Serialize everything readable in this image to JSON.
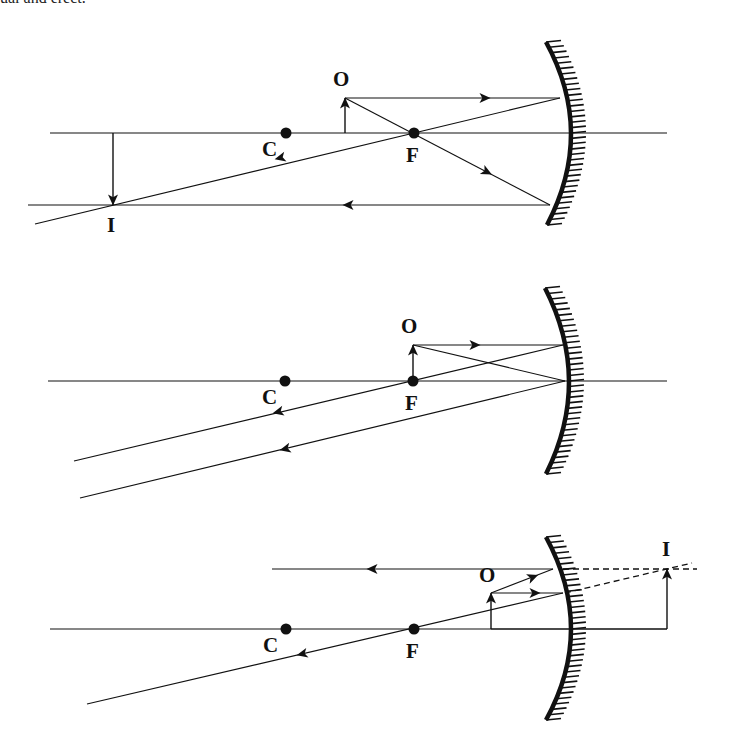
{
  "caption_fragment": "ual and erect.",
  "colors": {
    "ink": "#111111",
    "background": "#ffffff"
  },
  "diagrams": [
    {
      "id": "object-beyond-focus",
      "axis": {
        "y": 133,
        "x1": 50,
        "x2": 667
      },
      "mirror": {
        "top": [
          546,
          42
        ],
        "vertex": [
          571,
          133
        ],
        "bottom": [
          547,
          225
        ]
      },
      "points": [
        {
          "label": "C",
          "x": 286,
          "y": 133,
          "lx": 262,
          "ly": 156
        },
        {
          "label": "F",
          "x": 414,
          "y": 133,
          "lx": 406,
          "ly": 162
        }
      ],
      "object": {
        "label": "O",
        "x": 345,
        "y1": 133,
        "y2": 98,
        "lx": 333,
        "ly": 86,
        "dir": "up"
      },
      "image": {
        "label": "I",
        "x": 113,
        "y1": 133,
        "y2": 205,
        "lx": 107,
        "ly": 232,
        "dir": "down"
      },
      "rays": [
        {
          "pts": [
            [
              345,
              98
            ],
            [
              560,
              98
            ]
          ],
          "arrows": [
            [
              485,
              98,
              1,
              0
            ]
          ]
        },
        {
          "pts": [
            [
              560,
              98
            ],
            [
              35,
              224
            ]
          ],
          "arrows": [
            [
              280,
              158,
              -1,
              0.24
            ]
          ]
        },
        {
          "pts": [
            [
              345,
              98
            ],
            [
              550,
              205
            ]
          ],
          "arrows": [
            [
              487,
              172,
              1,
              0.52
            ]
          ]
        },
        {
          "pts": [
            [
              550,
              205
            ],
            [
              28,
              205
            ]
          ],
          "arrows": [
            [
              348,
              205,
              -1,
              0
            ]
          ]
        }
      ],
      "dashed": []
    },
    {
      "id": "object-at-focus",
      "axis": {
        "y": 381,
        "x1": 48,
        "x2": 667
      },
      "mirror": {
        "top": [
          545,
          288
        ],
        "vertex": [
          569,
          381
        ],
        "bottom": [
          546,
          474
        ]
      },
      "points": [
        {
          "label": "C",
          "x": 285,
          "y": 381,
          "lx": 262,
          "ly": 404
        },
        {
          "label": "F",
          "x": 413,
          "y": 381,
          "lx": 405,
          "ly": 410
        }
      ],
      "object": {
        "label": "O",
        "x": 413,
        "y1": 381,
        "y2": 345,
        "lx": 401,
        "ly": 333,
        "dir": "up"
      },
      "image": null,
      "rays": [
        {
          "pts": [
            [
              413,
              345
            ],
            [
              563,
              345
            ]
          ],
          "arrows": [
            [
              475,
              345,
              1,
              0
            ]
          ]
        },
        {
          "pts": [
            [
              563,
              345
            ],
            [
              74,
              461
            ]
          ],
          "arrows": [
            [
              278,
              412,
              -1,
              0.237
            ]
          ]
        },
        {
          "pts": [
            [
              413,
              345
            ],
            [
              565,
              381
            ]
          ],
          "arrows": []
        },
        {
          "pts": [
            [
              565,
              381
            ],
            [
              80,
              498
            ]
          ],
          "arrows": [
            [
              285,
              449,
              -1,
              0.241
            ]
          ]
        }
      ],
      "dashed": []
    },
    {
      "id": "object-inside-focus",
      "axis": {
        "y": 629,
        "x1": 50,
        "x2": 667
      },
      "mirror": {
        "top": [
          546,
          537
        ],
        "vertex": [
          571,
          629
        ],
        "bottom": [
          546,
          720
        ]
      },
      "points": [
        {
          "label": "C",
          "x": 286,
          "y": 629,
          "lx": 263,
          "ly": 652
        },
        {
          "label": "F",
          "x": 414,
          "y": 629,
          "lx": 406,
          "ly": 658
        }
      ],
      "object": {
        "label": "O",
        "x": 491,
        "y1": 629,
        "y2": 593,
        "lx": 479,
        "ly": 582,
        "dir": "up"
      },
      "image": {
        "label": "I",
        "x": 667,
        "y1": 629,
        "y2": 569,
        "lx": 662,
        "ly": 556,
        "dir": "up"
      },
      "extra_lines": [
        {
          "pts": [
            [
              491,
              629
            ],
            [
              667,
              629
            ]
          ]
        }
      ],
      "rays": [
        {
          "pts": [
            [
              491,
              593
            ],
            [
              563,
              593
            ]
          ],
          "arrows": [
            [
              535,
              593,
              1,
              0
            ]
          ]
        },
        {
          "pts": [
            [
              563,
              593
            ],
            [
              87,
              704
            ]
          ],
          "arrows": [
            [
              302,
              654,
              -1,
              0.233
            ]
          ]
        },
        {
          "pts": [
            [
              491,
              593
            ],
            [
              553,
              569
            ]
          ],
          "arrows": [
            [
              533,
              577,
              1,
              -0.39
            ]
          ]
        },
        {
          "pts": [
            [
              553,
              569
            ],
            [
              272,
              569
            ]
          ],
          "arrows": [
            [
              372,
              569,
              -1,
              0
            ]
          ]
        }
      ],
      "dashed": [
        {
          "pts": [
            [
              563,
              569
            ],
            [
              697,
              569
            ]
          ]
        },
        {
          "pts": [
            [
              565,
              593
            ],
            [
              692,
              563
            ]
          ]
        }
      ]
    }
  ]
}
